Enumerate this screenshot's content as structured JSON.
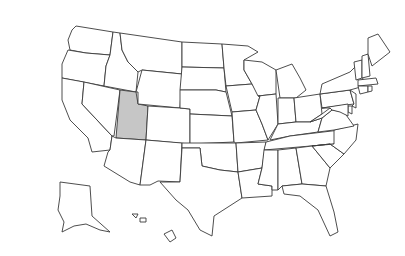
{
  "map": {
    "title": "United States map",
    "highlighted_state": "Utah",
    "highlight_color": "#c6c6c6",
    "fill_color": "#ffffff",
    "stroke_color": "#3a3a3a",
    "states": [
      {
        "name": "Washington",
        "d": "M76,26 L113,32 L110,55 L86,53 L70,50 L68,40 L72,30 Z"
      },
      {
        "name": "Oregon",
        "d": "M68,50 L86,53 L110,55 L106,66 L104,86 L62,78 L62,64 Z"
      },
      {
        "name": "California",
        "d": "M62,78 L84,82 L82,104 L112,136 L110,150 L92,152 L88,138 L70,120 L62,100 Z"
      },
      {
        "name": "Idaho",
        "d": "M113,32 L120,33 L122,50 L128,62 L138,72 L136,92 L104,86 L106,66 L110,55 Z"
      },
      {
        "name": "Nevada",
        "d": "M84,82 L120,90 L114,136 L112,136 L82,104 Z"
      },
      {
        "name": "Utah",
        "d": "M120,90 L136,92 L138,104 L148,106 L146,140 L116,138 Z",
        "highlight": true
      },
      {
        "name": "Arizona",
        "d": "M116,138 L146,140 L140,185 L130,182 L104,166 L108,152 L110,150 L112,136 Z"
      },
      {
        "name": "Montana",
        "d": "M120,33 L182,42 L182,74 L142,70 L138,72 L128,62 L122,50 Z"
      },
      {
        "name": "Wyoming",
        "d": "M142,70 L182,74 L180,108 L138,104 L138,92 L136,92 Z"
      },
      {
        "name": "Colorado",
        "d": "M148,106 L180,108 L190,109 L190,144 L146,140 Z"
      },
      {
        "name": "New Mexico",
        "d": "M146,140 L182,143 L180,182 L158,181 L150,185 L140,185 Z"
      },
      {
        "name": "North Dakota",
        "d": "M182,42 L222,44 L224,68 L182,67 Z"
      },
      {
        "name": "South Dakota",
        "d": "M182,67 L224,68 L226,92 L216,90 L180,90 Z"
      },
      {
        "name": "Nebraska",
        "d": "M180,90 L216,90 L226,92 L232,116 L190,114 L190,109 L180,108 Z"
      },
      {
        "name": "Kansas",
        "d": "M190,114 L232,116 L234,142 L190,144 Z"
      },
      {
        "name": "Oklahoma",
        "d": "M182,143 L236,143 L238,172 L220,170 L202,166 L200,148 L182,148 Z"
      },
      {
        "name": "Texas",
        "d": "M182,148 L200,148 L202,166 L220,170 L238,172 L242,198 L214,216 L212,236 L200,230 L188,210 L176,200 L160,182 L180,182 Z"
      },
      {
        "name": "Minnesota",
        "d": "M222,44 L248,46 L258,52 L244,60 L244,70 L252,84 L226,86 L224,68 Z"
      },
      {
        "name": "Iowa",
        "d": "M226,86 L252,84 L260,96 L256,110 L232,112 Z"
      },
      {
        "name": "Missouri",
        "d": "M232,112 L256,110 L262,124 L268,140 L236,143 L234,142 Z"
      },
      {
        "name": "Arkansas",
        "d": "M236,143 L266,142 L262,168 L238,172 Z"
      },
      {
        "name": "Louisiana",
        "d": "M238,172 L262,168 L258,184 L272,186 L272,196 L242,198 Z"
      },
      {
        "name": "Wisconsin",
        "d": "M244,60 L262,62 L276,70 L276,94 L258,96 L252,84 L244,70 Z"
      },
      {
        "name": "Illinois",
        "d": "M258,96 L276,94 L278,124 L268,140 L262,124 L256,110 L260,96 Z"
      },
      {
        "name": "Michigan",
        "d": "M276,70 L292,64 L300,78 L306,90 L296,98 L280,98 Z"
      },
      {
        "name": "Indiana",
        "d": "M278,98 L294,98 L296,122 L278,124 Z"
      },
      {
        "name": "Ohio",
        "d": "M294,98 L320,94 L322,114 L310,122 L296,122 Z"
      },
      {
        "name": "Kentucky",
        "d": "M270,140 L278,124 L296,122 L310,122 L322,118 L318,132 L290,136 Z"
      },
      {
        "name": "Tennessee",
        "d": "M266,142 L290,136 L340,130 L334,144 L264,150 Z"
      },
      {
        "name": "Mississippi",
        "d": "M262,168 L264,150 L278,150 L278,190 L272,190 L272,186 L258,184 Z"
      },
      {
        "name": "Alabama",
        "d": "M278,150 L296,148 L302,184 L282,186 L278,190 Z"
      },
      {
        "name": "Georgia",
        "d": "M296,148 L312,146 L330,168 L326,186 L302,184 Z"
      },
      {
        "name": "Florida",
        "d": "M282,186 L302,184 L326,186 L334,212 L338,232 L330,236 L318,210 L300,196 L284,194 Z"
      },
      {
        "name": "South Carolina",
        "d": "M312,146 L330,144 L344,154 L330,168 Z"
      },
      {
        "name": "North Carolina",
        "d": "M334,130 L358,124 L356,140 L344,154 L330,144 L312,146 L334,144 Z"
      },
      {
        "name": "Virginia",
        "d": "M318,132 L322,118 L332,110 L344,112 L354,126 L334,130 Z"
      },
      {
        "name": "West Virginia",
        "d": "M310,122 L322,114 L330,108 L332,110 L322,118 Z"
      },
      {
        "name": "Pennsylvania",
        "d": "M320,94 L350,90 L354,104 L322,108 Z"
      },
      {
        "name": "New York",
        "d": "M322,84 L350,72 L360,62 L364,86 L350,90 L320,94 Z"
      },
      {
        "name": "Vermont",
        "d": "M354,62 L362,60 L362,78 L356,80 Z"
      },
      {
        "name": "New Hampshire",
        "d": "M362,56 L368,54 L370,76 L362,78 Z"
      },
      {
        "name": "Maine",
        "d": "M368,38 L378,34 L390,52 L372,66 L368,54 Z"
      },
      {
        "name": "Massachusetts",
        "d": "M358,80 L376,78 L378,84 L358,86 Z"
      },
      {
        "name": "Connecticut",
        "d": "M358,86 L368,86 L368,92 L360,94 Z"
      },
      {
        "name": "Rhode Island",
        "d": "M368,86 L372,86 L372,91 L368,92 Z"
      },
      {
        "name": "New Jersey",
        "d": "M350,90 L356,94 L356,108 L352,106 L354,104 Z"
      },
      {
        "name": "Delaware",
        "d": "M348,106 L352,106 L352,114 L348,112 Z"
      },
      {
        "name": "Maryland",
        "d": "M322,108 L348,104 L348,116 L340,112 L332,110 L330,108 Z"
      },
      {
        "name": "Alaska",
        "d": "M60,182 L90,186 L92,216 L110,232 L100,230 L86,224 L74,226 L62,232 L64,222 L58,210 L60,196 Z"
      },
      {
        "name": "Hawaii",
        "d": "M164,234 L172,230 L176,238 L170,242 Z M140,218 L146,218 L146,222 L140,222 Z M132,214 L138,214 L136,218 Z"
      }
    ]
  }
}
